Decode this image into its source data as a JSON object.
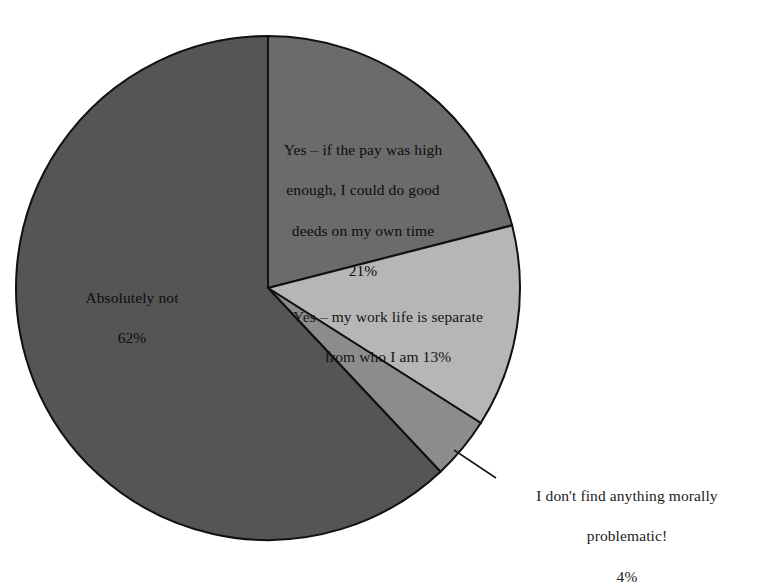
{
  "figure": {
    "background_color": "#ffffff",
    "outline_color": "#111111"
  },
  "chart_data": {
    "type": "pie",
    "title": "",
    "subtitle": "",
    "xlabel": "",
    "ylabel": "",
    "legend_position": "none",
    "grid": false,
    "start_angle_deg": 0,
    "direction": "clockwise",
    "categories": [
      "Yes – if the pay was high enough, I could do good deeds on my own time",
      "Yes – my work life is separate from who I am",
      "I don't find anything morally problematic!",
      "Absolutely not"
    ],
    "values": [
      21,
      13,
      4,
      62
    ],
    "value_unit": "%",
    "colors": [
      "#6b6b6b",
      "#b6b6b6",
      "#8c8c8c",
      "#555555"
    ],
    "slices": [
      {
        "name": "yes-if-pay-high",
        "label": "Yes – if the pay was high enough, I could do good deeds on my own time",
        "value": 21,
        "value_label": "21%",
        "color": "#6b6b6b"
      },
      {
        "name": "yes-work-life-separate",
        "label": "Yes – my work life is separate from who I am",
        "value": 13,
        "value_label": "13%",
        "color": "#b6b6b6"
      },
      {
        "name": "no-moral-problem",
        "label": "I don't find anything morally problematic!",
        "value": 4,
        "value_label": "4%",
        "color": "#8c8c8c"
      },
      {
        "name": "absolutely-not",
        "label": "Absolutely not",
        "value": 62,
        "value_label": "62%",
        "color": "#555555"
      }
    ]
  },
  "labels": {
    "yes_pay": {
      "line1": "Yes – if the pay was high",
      "line2": "enough, I could do good",
      "line3": "deeds on my own time",
      "line4": "21%"
    },
    "absolutely_not": {
      "line1": "Absolutely not",
      "line2": "62%"
    },
    "yes_separate": {
      "line1": "Yes – my work life is separate",
      "line2": "from who I am 13%"
    },
    "not_problematic": {
      "line1": "I don't find anything morally",
      "line2": "problematic!",
      "line3": "4%"
    }
  }
}
